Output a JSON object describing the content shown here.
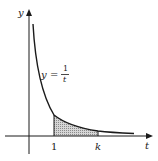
{
  "figure": {
    "type": "area-under-curve",
    "function_label": {
      "lhs": "y",
      "equals": "=",
      "numerator": "1",
      "denominator": "t"
    },
    "axes": {
      "x_label": "t",
      "y_label": "y"
    },
    "ticks": {
      "lower": "1",
      "upper": "k"
    },
    "shaded_region": "area under y = 1/t from t = 1 to t = k",
    "colors": {
      "line": "#1a1a1a",
      "shade": "#9a9a9a"
    }
  }
}
